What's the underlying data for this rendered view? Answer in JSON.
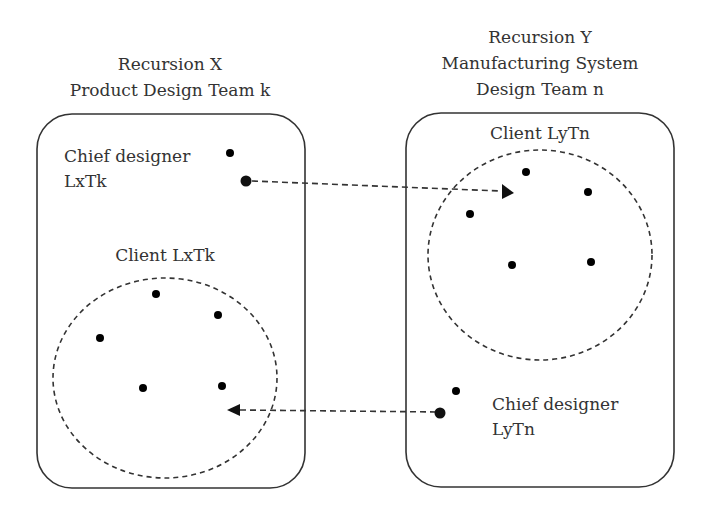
{
  "left_recursion": {
    "title_line1": "Recursion X",
    "title_line2": "Product Design Team k",
    "chief_line1": "Chief designer",
    "chief_line2": "LxTk",
    "client_label": "Client LxTk",
    "client_count": 5
  },
  "right_recursion": {
    "title_line1": "Recursion Y",
    "title_line2": "Manufacturing System",
    "title_line3": "Design Team n",
    "client_label": "Client LyTn",
    "chief_line1": "Chief designer",
    "chief_line2": "LyTn",
    "client_count": 5
  },
  "connections": [
    {
      "from": "Chief designer LxTk",
      "to": "Client LyTn",
      "style": "dashed-arrow"
    },
    {
      "from": "Chief designer LyTn",
      "to": "Client LxTk",
      "style": "dashed-arrow"
    }
  ]
}
